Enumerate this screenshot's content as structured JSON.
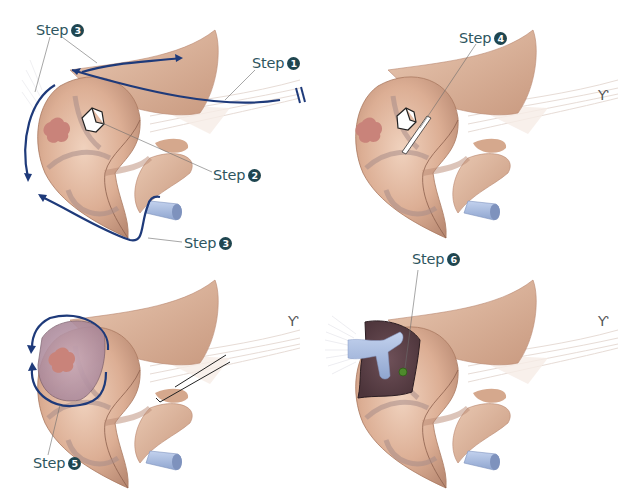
{
  "figure": {
    "panels": [
      {
        "id": "panel-1",
        "position": "top-left",
        "labels": [
          {
            "text": "Step",
            "num": "3",
            "x": 36,
            "y": 22
          },
          {
            "text": "Step",
            "num": "1",
            "x": 252,
            "y": 55
          },
          {
            "text": "Step",
            "num": "2",
            "x": 213,
            "y": 167
          },
          {
            "text": "Step",
            "num": "3",
            "x": 184,
            "y": 235
          }
        ]
      },
      {
        "id": "panel-2",
        "position": "top-right",
        "labels": [
          {
            "text": "Step",
            "num": "4",
            "x": 459,
            "y": 30
          }
        ]
      },
      {
        "id": "panel-3",
        "position": "bottom-left",
        "labels": [
          {
            "text": "Step",
            "num": "5",
            "x": 33,
            "y": 455
          }
        ]
      },
      {
        "id": "panel-4",
        "position": "bottom-right",
        "labels": [
          {
            "text": "Step",
            "num": "6",
            "x": 412,
            "y": 251
          }
        ]
      }
    ],
    "colors": {
      "label_text": "#2e5560",
      "badge_fill": "#1f4650",
      "arrow": "#1e3a7a",
      "tissue": "#dcae94",
      "tissue_dark": "#b88670",
      "lesion": "#c9837a",
      "vessel": "#9fb4d8",
      "excised_cavity": "#5b4148",
      "marker": "#4e8a2c"
    }
  }
}
